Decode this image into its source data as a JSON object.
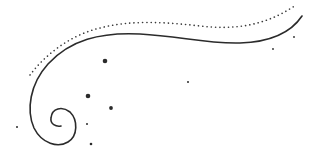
{
  "illustration": {
    "description": "decorative swirl flourish",
    "stroke_color": "#2b2b2b",
    "background": "#ffffff",
    "dots": [
      {
        "cx": 105,
        "cy": 61,
        "r": 2.3
      },
      {
        "cx": 88,
        "cy": 96,
        "r": 2.3
      },
      {
        "cx": 111,
        "cy": 108,
        "r": 1.9
      },
      {
        "cx": 87,
        "cy": 124,
        "r": 1.0
      },
      {
        "cx": 91,
        "cy": 144,
        "r": 1.3
      },
      {
        "cx": 17,
        "cy": 127,
        "r": 1.0
      },
      {
        "cx": 188,
        "cy": 82,
        "r": 1.0
      },
      {
        "cx": 273,
        "cy": 49,
        "r": 0.9
      },
      {
        "cx": 294,
        "cy": 37,
        "r": 0.9
      }
    ]
  }
}
